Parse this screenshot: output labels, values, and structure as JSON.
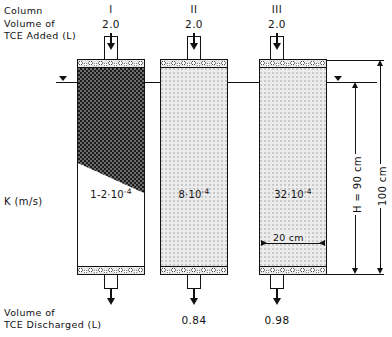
{
  "labels": {
    "column_row": "Column",
    "volume_added": "Volume of\nTCE Added (L)",
    "k_label": "K (m/s)",
    "volume_discharged": "Volume of\nTCE Discharged (L)"
  },
  "columns": [
    {
      "roman": "I",
      "volume_added": "2.0",
      "k_base": "1-2",
      "k_mult": "·10",
      "k_exp": "-4",
      "volume_discharged": "",
      "fill": "tce-dark"
    },
    {
      "roman": "II",
      "volume_added": "2.0",
      "k_base": "8",
      "k_mult": "·10",
      "k_exp": "-4",
      "volume_discharged": "0.84",
      "fill": "sand"
    },
    {
      "roman": "III",
      "volume_added": "2.0",
      "k_base": "32",
      "k_mult": "·10",
      "k_exp": "-4",
      "volume_discharged": "0.98",
      "fill": "sand"
    }
  ],
  "dimensions": {
    "height_h": "H = 90 cm",
    "height_total": "100 cm",
    "width": "20 cm"
  },
  "colors": {
    "ink": "#111111",
    "sand": "#ececec",
    "tce": "#1b1b1b"
  }
}
